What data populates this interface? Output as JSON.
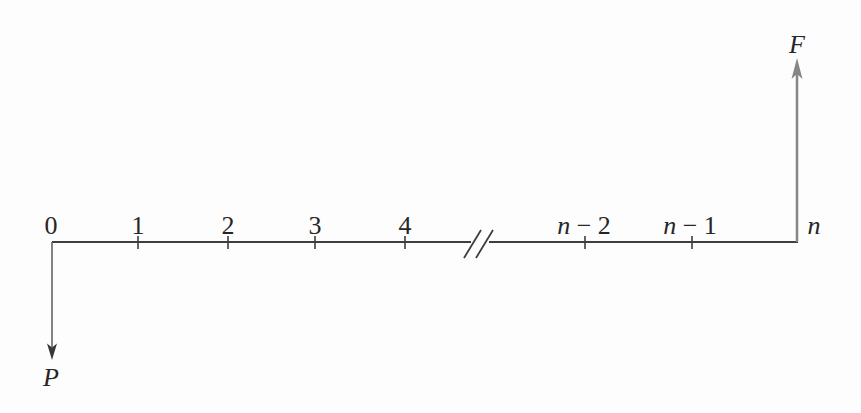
{
  "diagram": {
    "type": "cash-flow-timeline",
    "background_color": "#fdfdfd",
    "line_color": "#3e3e3e",
    "tick_color": "#3e3e3e",
    "text_color": "#262626",
    "future_arrow_color": "#868686",
    "present_arrow_shaft_color": "#636363",
    "present_arrow_head_color": "#383838",
    "timeline": {
      "ticks": [
        {
          "var": "",
          "rest": "0",
          "full": "0"
        },
        {
          "var": "",
          "rest": "1",
          "full": "1"
        },
        {
          "var": "",
          "rest": "2",
          "full": "2"
        },
        {
          "var": "",
          "rest": "3",
          "full": "3"
        },
        {
          "var": "",
          "rest": "4",
          "full": "4"
        },
        {
          "var": "n",
          "rest": " − 2",
          "full": "n − 2"
        },
        {
          "var": "n",
          "rest": " − 1",
          "full": "n − 1"
        },
        {
          "var": "n",
          "rest": "",
          "full": "n"
        }
      ],
      "break_icon": "axis-break-double-slash",
      "break_between": [
        "4",
        "n − 2"
      ]
    },
    "arrows": {
      "present": {
        "label": "P",
        "direction": "down",
        "position": "0"
      },
      "future": {
        "label": "F",
        "direction": "up",
        "position": "n"
      }
    }
  }
}
